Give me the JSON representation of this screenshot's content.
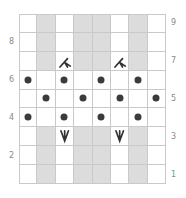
{
  "chart": {
    "type": "knitting-chart",
    "columns": 8,
    "rows": 9,
    "colors": {
      "no_stitch": "#dcdcdc",
      "stitch": "#ffffff",
      "grid": "#c9c9c9",
      "purl_dot": "#3b3b3b",
      "symbol": "#333333",
      "label": "#8a8a8a"
    },
    "row_labels_left": [
      "8",
      "6",
      "4",
      "2"
    ],
    "row_labels_right": [
      "9",
      "7",
      "5",
      "3",
      "1"
    ],
    "legend_symbols": {
      "dot": "purl",
      "decrease": "decrease-symbol",
      "increase": "increase-symbol"
    },
    "grid": [
      [
        "w",
        "g",
        "w",
        "g",
        "g",
        "w",
        "g",
        "w"
      ],
      [
        "w",
        "g",
        "w",
        "g",
        "g",
        "w",
        "g",
        "w"
      ],
      [
        "w",
        "g",
        "dec",
        "g",
        "g",
        "dec",
        "g",
        "w"
      ],
      [
        "dot",
        "w",
        "dot",
        "w",
        "dot",
        "w",
        "dot",
        "w"
      ],
      [
        "w",
        "dot",
        "w",
        "dot",
        "w",
        "dot",
        "w",
        "dot"
      ],
      [
        "dot",
        "w",
        "dot",
        "w",
        "dot",
        "w",
        "dot",
        "w"
      ],
      [
        "w",
        "g",
        "inc",
        "g",
        "g",
        "inc",
        "g",
        "w"
      ],
      [
        "w",
        "g",
        "w",
        "g",
        "g",
        "w",
        "g",
        "w"
      ],
      [
        "w",
        "g",
        "w",
        "g",
        "g",
        "w",
        "g",
        "w"
      ]
    ]
  }
}
